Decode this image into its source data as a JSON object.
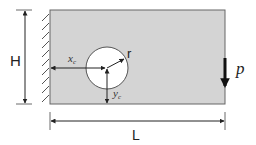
{
  "diagram": {
    "colors": {
      "plate_fill": "#d4d4d4",
      "plate_stroke": "#555555",
      "hole_fill": "#ffffff",
      "line": "#222222",
      "load": "#111111"
    },
    "labels": {
      "height": "H",
      "length": "L",
      "hole_x": "x",
      "hole_x_sub": "c",
      "hole_y": "y",
      "hole_y_sub": "c",
      "radius": "r",
      "load": "p"
    },
    "elements": {
      "support": "fixed wall (hatched) on left edge",
      "plate": "rectangular plate",
      "hole": "circular hole at (xc, yc) with radius r",
      "load": "downward point load p at right edge"
    }
  }
}
